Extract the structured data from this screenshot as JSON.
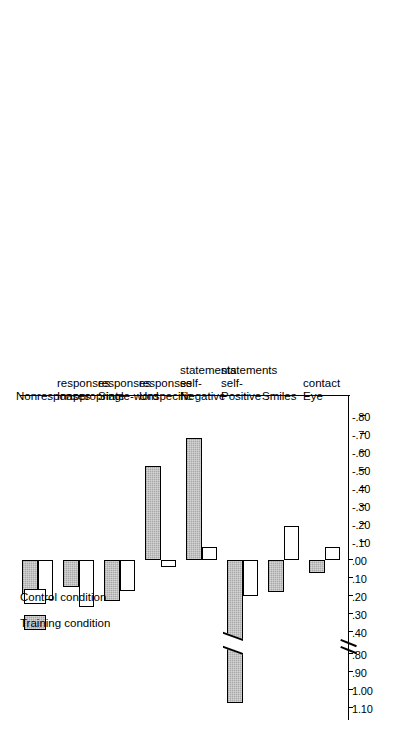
{
  "figure": {
    "orientation": "rotated-90-ccw",
    "background_color": "#ffffff",
    "bar_outline_color": "#000000"
  },
  "legend": {
    "position": "upper-left",
    "entries": [
      {
        "label": "Training condition",
        "swatch": "gray-filled-swatch",
        "color": "#a8a8a8"
      },
      {
        "label": "Control condition",
        "swatch": "white-empty-swatch",
        "color": "#ffffff"
      }
    ]
  },
  "axis": {
    "tick_labels": [
      "1.10",
      "1.00",
      ".90",
      ".80",
      ".40",
      ".30",
      ".20",
      ".10",
      ".00",
      "-.10",
      "-.20",
      "-.30",
      "-.40",
      "-.50",
      "-.60",
      "-.70",
      "-.80"
    ],
    "has_break": true,
    "break_between": [
      ".80",
      ".40"
    ],
    "zero_label": ".00"
  },
  "chart_data": {
    "type": "bar",
    "orientation": "horizontal",
    "title": "",
    "xlabel": "",
    "ylabel": "",
    "grid": false,
    "legend_position": "upper-left",
    "axis_break": {
      "from": 0.8,
      "to": 0.4
    },
    "ylim": [
      -0.8,
      1.1
    ],
    "tick_values": [
      1.1,
      1.0,
      0.9,
      0.8,
      0.4,
      0.3,
      0.2,
      0.1,
      0.0,
      -0.1,
      -0.2,
      -0.3,
      -0.4,
      -0.5,
      -0.6,
      -0.7,
      -0.8
    ],
    "tick_labels": [
      "1.10",
      "1.00",
      ".90",
      ".80",
      ".40",
      ".30",
      ".20",
      ".10",
      ".00",
      "-.10",
      "-.20",
      "-.30",
      "-.40",
      "-.50",
      "-.60",
      "-.70",
      "-.80"
    ],
    "categories": [
      "Eye contact",
      "Smiles",
      "Positive self-statements",
      "Negative self-statements",
      "Unspecific responses",
      "Single-word responses",
      "Inappropriate responses",
      "Nonresponses"
    ],
    "category_label_lines": [
      [
        "Eye",
        "contact"
      ],
      [
        "Smiles"
      ],
      [
        "Positive",
        "self-",
        "statements"
      ],
      [
        "Negative",
        "self-",
        "statements"
      ],
      [
        "Unspecific",
        "responses"
      ],
      [
        "Single-word",
        "responses"
      ],
      [
        "Inappropriate",
        "responses"
      ],
      [
        "Nonresponses"
      ]
    ],
    "series": [
      {
        "name": "Training condition",
        "color": "#a8a8a8",
        "values": [
          0.07,
          0.18,
          1.07,
          -0.68,
          -0.52,
          0.23,
          0.15,
          0.19
        ]
      },
      {
        "name": "Control condition",
        "color": "#ffffff",
        "values": [
          -0.07,
          -0.19,
          0.2,
          -0.07,
          0.04,
          0.17,
          0.26,
          0.22
        ]
      }
    ]
  }
}
